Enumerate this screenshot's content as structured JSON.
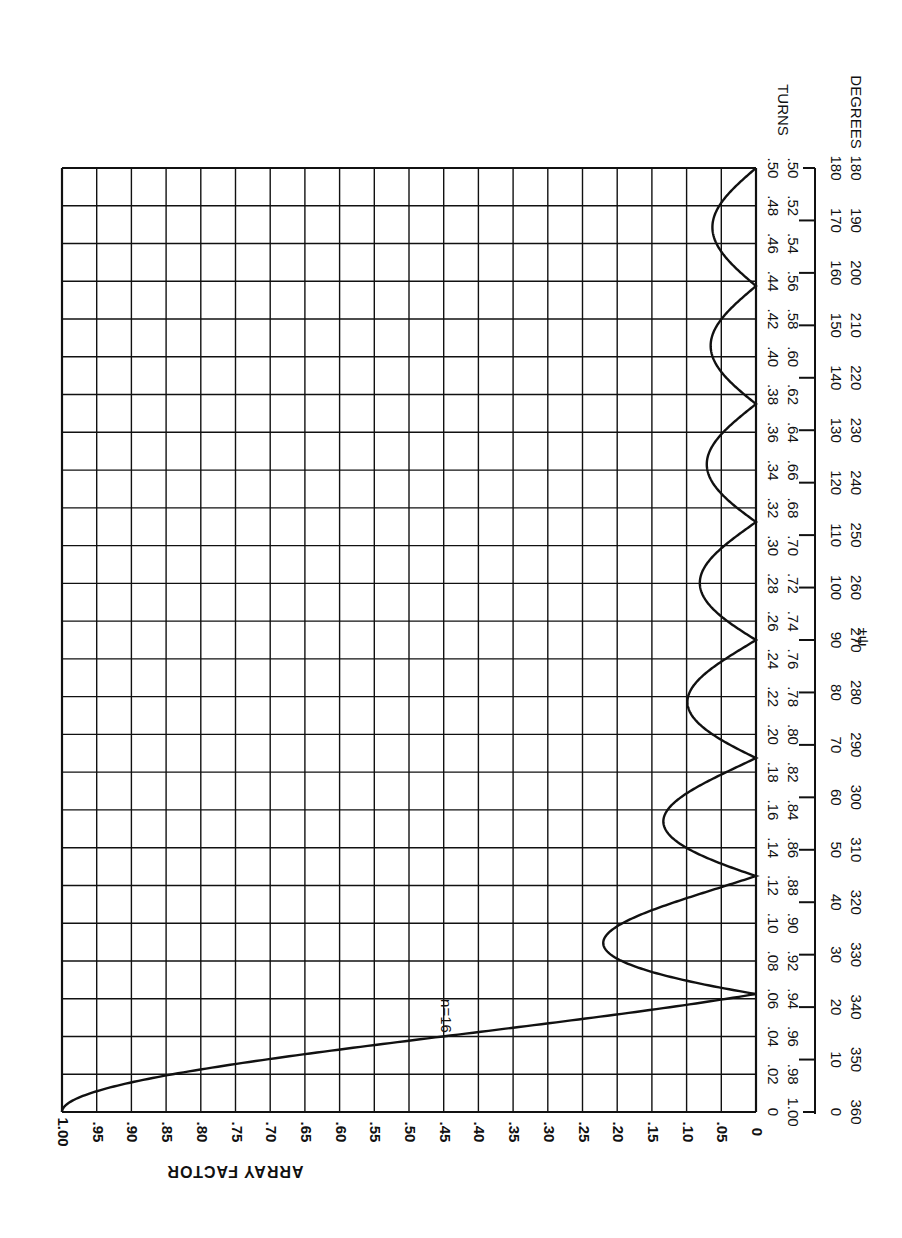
{
  "chart_data": {
    "type": "line",
    "title": "",
    "orientation": "rotated 90° (x-axis vertical on right, y-axis horizontal along bottom, read upside-down)",
    "xlabel": "±ψ",
    "ylabel": "ARRAY FACTOR",
    "x_scale_labels": {
      "turns_title": "TURNS",
      "degrees_title": "DEGREES",
      "turns_primary": [
        "0",
        ".02",
        ".04",
        ".06",
        ".08",
        ".10",
        ".12",
        ".14",
        ".16",
        ".18",
        ".20",
        ".22",
        ".24",
        ".26",
        ".28",
        ".30",
        ".32",
        ".34",
        ".36",
        ".38",
        ".40",
        ".42",
        ".44",
        ".46",
        ".48",
        ".50"
      ],
      "turns_secondary": [
        "1.00",
        ".98",
        ".96",
        ".94",
        ".92",
        ".90",
        ".88",
        ".86",
        ".84",
        ".82",
        ".80",
        ".78",
        ".76",
        ".74",
        ".72",
        ".70",
        ".68",
        ".66",
        ".64",
        ".62",
        ".60",
        ".58",
        ".56",
        ".54",
        ".52",
        ".50"
      ],
      "degrees_primary": [
        "0",
        "10",
        "20",
        "30",
        "40",
        "50",
        "60",
        "70",
        "80",
        "90",
        "100",
        "110",
        "120",
        "130",
        "140",
        "150",
        "160",
        "170",
        "180"
      ],
      "degrees_secondary": [
        "360",
        "350",
        "340",
        "330",
        "320",
        "310",
        "300",
        "290",
        "280",
        "270",
        "260",
        "250",
        "240",
        "230",
        "220",
        "210",
        "200",
        "190",
        "180"
      ]
    },
    "y_tick_labels": [
      "1.00",
      ".95",
      ".90",
      ".85",
      ".80",
      ".75",
      ".70",
      ".65",
      ".60",
      ".55",
      ".50",
      ".45",
      ".40",
      ".35",
      ".30",
      ".25",
      ".20",
      ".15",
      ".10",
      ".05",
      "0"
    ],
    "xlim_turns": [
      0,
      0.5
    ],
    "ylim": [
      0,
      1.0
    ],
    "grid": true,
    "series": [
      {
        "name": "n=16",
        "n": 16,
        "formula": "|sin(n·ψ/2) / (n·sin(ψ/2))|",
        "x_turns": [
          0,
          0.02,
          0.03,
          0.04,
          0.05,
          0.0625,
          0.08,
          0.09375,
          0.11,
          0.125,
          0.14,
          0.15625,
          0.17,
          0.1875,
          0.21,
          0.21875,
          0.23,
          0.25,
          0.27,
          0.28125,
          0.3,
          0.3125,
          0.33,
          0.34375,
          0.36,
          0.375,
          0.39,
          0.40625,
          0.42,
          0.4375,
          0.45,
          0.46875,
          0.49,
          0.5
        ],
        "values": [
          1.0,
          0.85,
          0.68,
          0.47,
          0.25,
          0.0,
          0.19,
          0.217,
          0.15,
          0.0,
          0.1,
          0.132,
          0.1,
          0.0,
          0.085,
          0.098,
          0.08,
          0.0,
          0.07,
          0.081,
          0.06,
          0.0,
          0.06,
          0.072,
          0.06,
          0.0,
          0.05,
          0.067,
          0.05,
          0.0,
          0.04,
          0.064,
          0.02,
          0.0
        ]
      }
    ],
    "annotations": [
      {
        "text": "n=16",
        "at_turns": 0.05,
        "at_value": 0.45
      }
    ],
    "legend": "none"
  },
  "labels": {
    "ylabel": "ARRAY FACTOR",
    "xlabel": "±ψ",
    "turns": "TURNS",
    "degrees": "DEGREES",
    "curve_label": "n=16"
  }
}
